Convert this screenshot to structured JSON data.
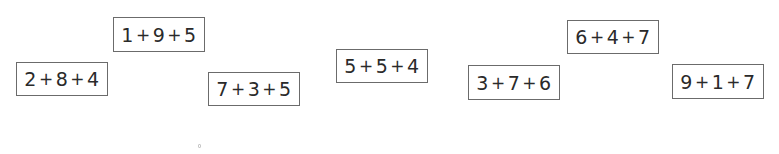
{
  "boxes": [
    {
      "id": "box-1-9-5",
      "text": "1 + 9 + 5",
      "terms": [
        "1",
        "9",
        "5"
      ],
      "x": 113,
      "y": 17,
      "w": 92,
      "h": 35
    },
    {
      "id": "box-2-8-4",
      "text": "2 + 8 + 4",
      "terms": [
        "2",
        "8",
        "4"
      ],
      "x": 16,
      "y": 62,
      "w": 92,
      "h": 34
    },
    {
      "id": "box-7-3-5",
      "text": "7 + 3 + 5",
      "terms": [
        "7",
        "3",
        "5"
      ],
      "x": 208,
      "y": 72,
      "w": 92,
      "h": 34
    },
    {
      "id": "box-5-5-4",
      "text": "5 + 5 + 4",
      "terms": [
        "5",
        "5",
        "4"
      ],
      "x": 336,
      "y": 49,
      "w": 92,
      "h": 34
    },
    {
      "id": "box-3-7-6",
      "text": "3 + 7 + 6",
      "terms": [
        "3",
        "7",
        "6"
      ],
      "x": 468,
      "y": 65,
      "w": 92,
      "h": 35
    },
    {
      "id": "box-6-4-7",
      "text": "6 + 4 + 7",
      "terms": [
        "6",
        "4",
        "7"
      ],
      "x": 567,
      "y": 20,
      "w": 92,
      "h": 34
    },
    {
      "id": "box-9-1-7",
      "text": "9 + 1 + 7",
      "terms": [
        "9",
        "1",
        "7"
      ],
      "x": 672,
      "y": 64,
      "w": 92,
      "h": 35
    }
  ],
  "operator": "+",
  "dot": {
    "x": 198,
    "y": 144
  }
}
